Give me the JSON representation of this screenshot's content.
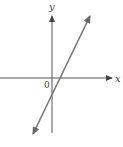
{
  "diagram": {
    "x_axis_label": "x",
    "y_axis_label": "y",
    "origin_label": "0",
    "colors": {
      "axis": "#555555",
      "line": "#777777",
      "text": "#444444",
      "background": "#ffffff"
    }
  }
}
